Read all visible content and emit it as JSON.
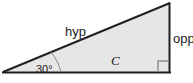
{
  "figure": {
    "type": "right-triangle-trigonometry-diagram",
    "background_color": "#ffffff",
    "fill_color": "#e6e6e6",
    "stroke_color": "#231f20",
    "thin_stroke_color": "#8c8c8c",
    "labels": {
      "hypotenuse": "hyp",
      "opposite": "opp",
      "interior": "C",
      "angle": "30°"
    },
    "geometry": {
      "vertices": {
        "left": [
          3,
          72
        ],
        "bottom_right": [
          170,
          72
        ],
        "top_right": [
          170,
          3
        ]
      },
      "angle_arc_radius": 48,
      "right_angle_marker_size": 11
    }
  }
}
